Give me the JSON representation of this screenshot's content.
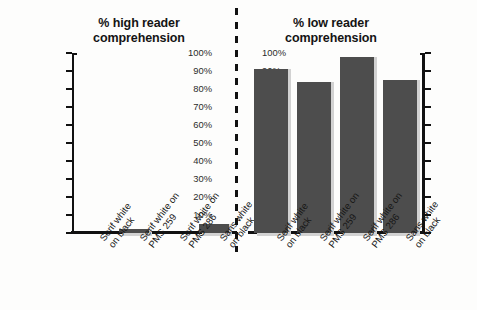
{
  "figure": {
    "background_color": "#fdfdfc",
    "bar_color": "#4d4d4d",
    "bar_shadow_color": "#d2d2d2",
    "axis_color": "#111111",
    "divider": "dashed-vertical-separator"
  },
  "axis": {
    "ticks": [
      "100%",
      "90%",
      "80%",
      "70%",
      "60%",
      "50%",
      "40%",
      "30%",
      "20%",
      "10%",
      "0%"
    ],
    "tick_values": [
      100,
      90,
      80,
      70,
      60,
      50,
      40,
      30,
      20,
      10,
      0
    ]
  },
  "chart_data": [
    {
      "type": "bar",
      "title": "% high reader comprehension",
      "title_line1": "% high reader",
      "title_line2": "comprehension",
      "categories": [
        "Serif white on black",
        "Serif white on PMS 259",
        "Serif white on PMS 286",
        "Sans white on black"
      ],
      "category_lines": [
        [
          "Serif white",
          "on black"
        ],
        [
          "Serif white on",
          "PMS 259"
        ],
        [
          "Serif white on",
          "PMS 286"
        ],
        [
          "Sans white",
          "on black"
        ]
      ],
      "values": [
        0,
        2,
        0,
        5
      ],
      "xlabel": "",
      "ylabel": "",
      "ylim": [
        0,
        100
      ],
      "grid": false,
      "legend": "none",
      "axis_position": "left"
    },
    {
      "type": "bar",
      "title": "% low reader comprehension",
      "title_line1": "% low reader",
      "title_line2": "comprehension",
      "categories": [
        "Serif white on black",
        "Serif white on PMS 259",
        "Serif white on PMS 286",
        "Sans white on black"
      ],
      "category_lines": [
        [
          "Serif white",
          "on black"
        ],
        [
          "Serif white on",
          "PMS 259"
        ],
        [
          "Serif white on",
          "PMS 286"
        ],
        [
          "Sans white",
          "on black"
        ]
      ],
      "values": [
        91,
        84,
        98,
        85
      ],
      "xlabel": "",
      "ylabel": "",
      "ylim": [
        0,
        100
      ],
      "grid": false,
      "legend": "none",
      "axis_position": "right"
    }
  ]
}
